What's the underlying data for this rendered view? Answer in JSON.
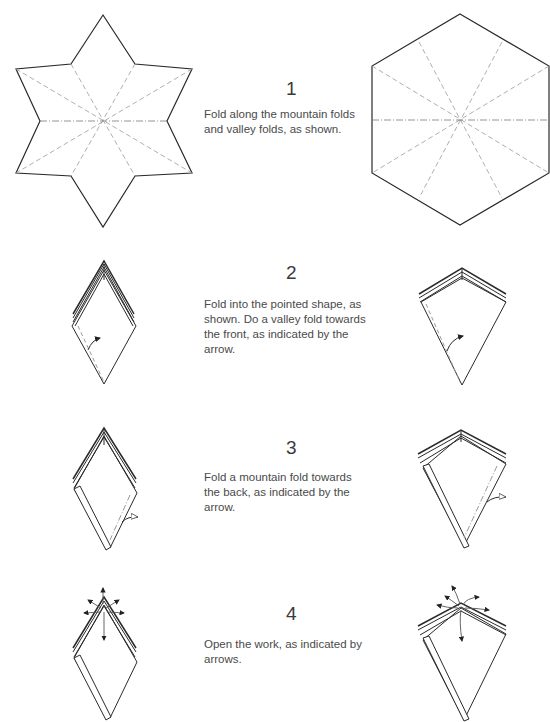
{
  "steps": [
    {
      "number": "1",
      "text": "Fold along the mountain folds and valley folds, as shown.",
      "left_figure": "six-pointed-star-crease-pattern",
      "right_figure": "hexagon-crease-pattern"
    },
    {
      "number": "2",
      "text": "Fold into the pointed shape, as shown. Do a valley fold towards the front, as indicated by the arrow.",
      "left_figure": "pointed-shape-valley-fold",
      "right_figure": "kite-shape-valley-fold"
    },
    {
      "number": "3",
      "text": "Fold a mountain fold towards the back, as indicated by the arrow.",
      "left_figure": "pointed-shape-mountain-fold",
      "right_figure": "kite-shape-mountain-fold"
    },
    {
      "number": "4",
      "text": "Open the work, as indicated by arrows.",
      "left_figure": "pointed-shape-open-arrows",
      "right_figure": "kite-shape-open-arrows"
    }
  ],
  "colors": {
    "outline": "#2a2a2a",
    "crease": "#9a9a9a",
    "text": "#4a4a4a"
  }
}
